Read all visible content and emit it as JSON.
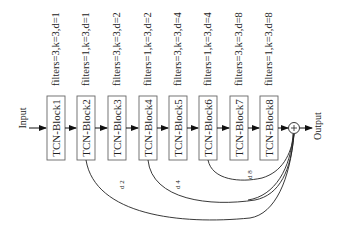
{
  "diagram": {
    "input_label": "Input",
    "output_label": "Output",
    "sum_symbol": "+",
    "blocks": [
      {
        "name": "TCN-Block1",
        "config": "filters=3,k=3,d=1"
      },
      {
        "name": "TCN-Block2",
        "config": "filters=1,k=3,d=1"
      },
      {
        "name": "TCN-Block3",
        "config": "filters=3,k=3,d=2"
      },
      {
        "name": "TCN-Block4",
        "config": "filters=1,k=3,d=2"
      },
      {
        "name": "TCN-Block5",
        "config": "filters=3,k=3,d=4"
      },
      {
        "name": "TCN-Block6",
        "config": "filters=1,k=3,d=4"
      },
      {
        "name": "TCN-Block7",
        "config": "filters=3,k=3,d=8"
      },
      {
        "name": "TCN-Block8",
        "config": "filters=1,k=3,d=8"
      }
    ],
    "skip_labels": [
      "d 2",
      "d 4",
      "d 8"
    ],
    "colors": {
      "line": "#222222",
      "box_border": "#555555"
    }
  }
}
